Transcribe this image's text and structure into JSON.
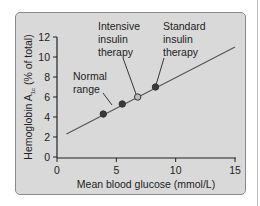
{
  "chart_data": {
    "type": "scatter",
    "title": "",
    "xlabel": "Mean blood glucose (mmol/L)",
    "ylabel": "Hemoglobin A1c (% of total)",
    "ylabel_main": "Hemoglobin A",
    "ylabel_sub": "1c",
    "ylabel_rest": " (% of total)",
    "xlim": [
      0,
      15
    ],
    "ylim": [
      0,
      12
    ],
    "x_ticks": [
      "0",
      "5",
      "10",
      "15"
    ],
    "y_ticks": [
      "0",
      "2",
      "4",
      "6",
      "8",
      "10",
      "12"
    ],
    "grid": false,
    "trend_line": {
      "x": [
        0.8,
        15
      ],
      "y": [
        2.3,
        11.0
      ]
    },
    "points": [
      {
        "x": 3.9,
        "y": 4.3,
        "fill": "#3a3a3a",
        "label": ""
      },
      {
        "x": 5.5,
        "y": 5.3,
        "fill": "#3a3a3a",
        "label": ""
      },
      {
        "x": 6.8,
        "y": 6.0,
        "fill": "#bdbdbd",
        "label": "Intensive insulin therapy"
      },
      {
        "x": 8.3,
        "y": 7.0,
        "fill": "#3a3a3a",
        "label": "Standard insulin therapy"
      }
    ],
    "annotations": [
      {
        "text": [
          "Normal",
          "range"
        ]
      },
      {
        "text": [
          "Intensive",
          "insulin",
          "therapy"
        ]
      },
      {
        "text": [
          "Standard",
          "insulin",
          "therapy"
        ]
      }
    ]
  }
}
